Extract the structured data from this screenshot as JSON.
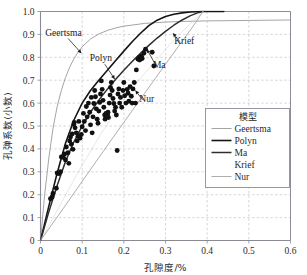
{
  "figure": {
    "name": "porosity-vs-pore-elastic-coefficient-scatter"
  },
  "chart_data": {
    "type": "scatter",
    "title": "",
    "xlabel": "孔隙度/%",
    "ylabel": "孔弹系数(小数)",
    "xlim": [
      0,
      0.6
    ],
    "ylim": [
      0,
      1.0
    ],
    "xticks": [
      "0",
      "0.1",
      "0.2",
      "0.3",
      "0.4",
      "0.5",
      "0.6"
    ],
    "xtick_values": [
      0,
      0.1,
      0.2,
      0.3,
      0.4,
      0.5,
      0.6
    ],
    "yticks": [
      "0",
      "0.1",
      "0.2",
      "0.3",
      "0.4",
      "0.5",
      "0.6",
      "0.7",
      "0.8",
      "0.9",
      "1.0"
    ],
    "ytick_values": [
      0,
      0.1,
      0.2,
      0.3,
      0.4,
      0.5,
      0.6,
      0.7,
      0.8,
      0.9,
      1.0
    ],
    "grid": true,
    "legend": {
      "position": "right-middle",
      "title": "模型",
      "entries": [
        {
          "label": "Geertsma",
          "color": "#9a9a9a",
          "width": 0.9,
          "sample": true
        },
        {
          "label": "Polyn",
          "color": "#151515",
          "width": 1.6,
          "sample": true
        },
        {
          "label": "Ma",
          "color": "#2e2e2e",
          "width": 1.5,
          "sample": true
        },
        {
          "label": "Krief",
          "color": "#cfcfcf",
          "width": 0.5,
          "sample": false
        },
        {
          "label": "Nur",
          "color": "#a5a5a5",
          "width": 0.9,
          "sample": true
        }
      ]
    },
    "annotations": [
      {
        "label": "Geertsma",
        "x": 0.055,
        "y": 0.905,
        "arrow_to": [
          0.098,
          0.818
        ]
      },
      {
        "label": "Polyn",
        "x": 0.145,
        "y": 0.795,
        "arrow_to": [
          0.178,
          0.705
        ]
      },
      {
        "label": "Ma",
        "x": 0.285,
        "y": 0.74,
        "arrow_to": [
          0.255,
          0.835
        ]
      },
      {
        "label": "Krief",
        "x": 0.345,
        "y": 0.845,
        "arrow_to": [
          0.318,
          0.905
        ]
      },
      {
        "label": "Nur",
        "x": 0.255,
        "y": 0.59,
        "arrow_to": [
          0.228,
          0.655
        ]
      }
    ],
    "series": [
      {
        "name": "Geertsma",
        "type": "line",
        "color": "#9a9a9a",
        "points": [
          [
            0,
            0
          ],
          [
            0.01,
            0.2
          ],
          [
            0.02,
            0.36
          ],
          [
            0.03,
            0.49
          ],
          [
            0.04,
            0.585
          ],
          [
            0.05,
            0.655
          ],
          [
            0.06,
            0.712
          ],
          [
            0.07,
            0.757
          ],
          [
            0.08,
            0.793
          ],
          [
            0.09,
            0.822
          ],
          [
            0.1,
            0.846
          ],
          [
            0.12,
            0.88
          ],
          [
            0.14,
            0.902
          ],
          [
            0.16,
            0.917
          ],
          [
            0.18,
            0.928
          ],
          [
            0.2,
            0.936
          ],
          [
            0.25,
            0.948
          ],
          [
            0.3,
            0.954
          ],
          [
            0.35,
            0.957
          ],
          [
            0.4,
            0.959
          ],
          [
            0.45,
            0.96
          ],
          [
            0.5,
            0.961
          ],
          [
            0.55,
            0.962
          ],
          [
            0.6,
            0.963
          ]
        ]
      },
      {
        "name": "Polyn",
        "type": "line",
        "color": "#151515",
        "points": [
          [
            0,
            0
          ],
          [
            0.02,
            0.15
          ],
          [
            0.04,
            0.295
          ],
          [
            0.06,
            0.425
          ],
          [
            0.08,
            0.525
          ],
          [
            0.1,
            0.6
          ],
          [
            0.12,
            0.655
          ],
          [
            0.14,
            0.7
          ],
          [
            0.16,
            0.742
          ],
          [
            0.18,
            0.785
          ],
          [
            0.2,
            0.827
          ],
          [
            0.22,
            0.868
          ],
          [
            0.24,
            0.905
          ],
          [
            0.26,
            0.938
          ],
          [
            0.28,
            0.962
          ],
          [
            0.3,
            0.978
          ],
          [
            0.32,
            0.988
          ],
          [
            0.34,
            0.994
          ],
          [
            0.36,
            0.998
          ],
          [
            0.385,
            1.0
          ],
          [
            0.44,
            1.0
          ]
        ]
      },
      {
        "name": "Ma",
        "type": "line",
        "color": "#2e2e2e",
        "points": [
          [
            0,
            0
          ],
          [
            0.02,
            0.125
          ],
          [
            0.04,
            0.24
          ],
          [
            0.06,
            0.345
          ],
          [
            0.08,
            0.43
          ],
          [
            0.1,
            0.5
          ],
          [
            0.12,
            0.56
          ],
          [
            0.14,
            0.613
          ],
          [
            0.16,
            0.66
          ],
          [
            0.18,
            0.703
          ],
          [
            0.2,
            0.743
          ],
          [
            0.22,
            0.782
          ],
          [
            0.24,
            0.818
          ],
          [
            0.26,
            0.852
          ],
          [
            0.28,
            0.884
          ],
          [
            0.3,
            0.913
          ],
          [
            0.32,
            0.94
          ],
          [
            0.34,
            0.963
          ],
          [
            0.36,
            0.982
          ],
          [
            0.38,
            0.996
          ],
          [
            0.39,
            1.0
          ]
        ]
      },
      {
        "name": "Krief",
        "type": "line",
        "color": "#cfcfcf",
        "points": [
          [
            0,
            0
          ],
          [
            0.05,
            0.165
          ],
          [
            0.1,
            0.33
          ],
          [
            0.15,
            0.48
          ],
          [
            0.2,
            0.615
          ],
          [
            0.25,
            0.73
          ],
          [
            0.28,
            0.793
          ],
          [
            0.31,
            0.855
          ],
          [
            0.34,
            0.912
          ],
          [
            0.36,
            0.947
          ],
          [
            0.38,
            0.98
          ],
          [
            0.39,
            1.0
          ]
        ]
      },
      {
        "name": "Nur",
        "type": "line",
        "color": "#a5a5a5",
        "points": [
          [
            0,
            0
          ],
          [
            0.05,
            0.128
          ],
          [
            0.1,
            0.258
          ],
          [
            0.15,
            0.388
          ],
          [
            0.2,
            0.516
          ],
          [
            0.25,
            0.643
          ],
          [
            0.3,
            0.77
          ],
          [
            0.34,
            0.87
          ],
          [
            0.37,
            0.945
          ],
          [
            0.39,
            1.0
          ]
        ]
      },
      {
        "name": "measured data",
        "type": "scatter",
        "marker": "filled-circle",
        "color": "#111111",
        "points": [
          [
            0.024,
            0.182
          ],
          [
            0.028,
            0.19
          ],
          [
            0.03,
            0.205
          ],
          [
            0.038,
            0.228
          ],
          [
            0.04,
            0.295
          ],
          [
            0.044,
            0.292
          ],
          [
            0.048,
            0.3
          ],
          [
            0.05,
            0.365
          ],
          [
            0.055,
            0.362
          ],
          [
            0.058,
            0.378
          ],
          [
            0.06,
            0.352
          ],
          [
            0.062,
            0.408
          ],
          [
            0.066,
            0.383
          ],
          [
            0.068,
            0.337
          ],
          [
            0.07,
            0.435
          ],
          [
            0.072,
            0.452
          ],
          [
            0.074,
            0.42
          ],
          [
            0.076,
            0.465
          ],
          [
            0.078,
            0.398
          ],
          [
            0.08,
            0.507
          ],
          [
            0.081,
            0.516
          ],
          [
            0.083,
            0.492
          ],
          [
            0.086,
            0.47
          ],
          [
            0.088,
            0.435
          ],
          [
            0.09,
            0.455
          ],
          [
            0.092,
            0.52
          ],
          [
            0.095,
            0.447
          ],
          [
            0.098,
            0.463
          ],
          [
            0.1,
            0.497
          ],
          [
            0.103,
            0.555
          ],
          [
            0.105,
            0.52
          ],
          [
            0.108,
            0.48
          ],
          [
            0.11,
            0.585
          ],
          [
            0.112,
            0.54
          ],
          [
            0.115,
            0.6
          ],
          [
            0.118,
            0.56
          ],
          [
            0.12,
            0.505
          ],
          [
            0.122,
            0.625
          ],
          [
            0.124,
            0.47
          ],
          [
            0.126,
            0.54
          ],
          [
            0.128,
            0.598
          ],
          [
            0.13,
            0.655
          ],
          [
            0.132,
            0.628
          ],
          [
            0.134,
            0.575
          ],
          [
            0.136,
            0.53
          ],
          [
            0.138,
            0.512
          ],
          [
            0.14,
            0.565
          ],
          [
            0.142,
            0.603
          ],
          [
            0.144,
            0.64
          ],
          [
            0.146,
            0.697
          ],
          [
            0.148,
            0.66
          ],
          [
            0.15,
            0.612
          ],
          [
            0.152,
            0.582
          ],
          [
            0.154,
            0.548
          ],
          [
            0.155,
            0.53
          ],
          [
            0.157,
            0.555
          ],
          [
            0.158,
            0.54
          ],
          [
            0.16,
            0.545
          ],
          [
            0.161,
            0.552
          ],
          [
            0.162,
            0.56
          ],
          [
            0.163,
            0.537
          ],
          [
            0.165,
            0.6
          ],
          [
            0.167,
            0.635
          ],
          [
            0.168,
            0.668
          ],
          [
            0.17,
            0.69
          ],
          [
            0.172,
            0.655
          ],
          [
            0.174,
            0.62
          ],
          [
            0.176,
            0.598
          ],
          [
            0.178,
            0.565
          ],
          [
            0.18,
            0.582
          ],
          [
            0.182,
            0.548
          ],
          [
            0.184,
            0.393
          ],
          [
            0.186,
            0.64
          ],
          [
            0.188,
            0.662
          ],
          [
            0.19,
            0.6
          ],
          [
            0.192,
            0.625
          ],
          [
            0.195,
            0.582
          ],
          [
            0.198,
            0.655
          ],
          [
            0.2,
            0.69
          ],
          [
            0.202,
            0.632
          ],
          [
            0.205,
            0.6
          ],
          [
            0.208,
            0.66
          ],
          [
            0.21,
            0.643
          ],
          [
            0.212,
            0.608
          ],
          [
            0.215,
            0.672
          ],
          [
            0.218,
            0.63
          ],
          [
            0.22,
            0.6
          ],
          [
            0.222,
            0.662
          ],
          [
            0.225,
            0.69
          ],
          [
            0.228,
            0.6
          ],
          [
            0.23,
            0.745
          ],
          [
            0.234,
            0.792
          ],
          [
            0.236,
            0.798
          ],
          [
            0.238,
            0.788
          ],
          [
            0.24,
            0.8
          ],
          [
            0.242,
            0.805
          ],
          [
            0.244,
            0.795
          ],
          [
            0.248,
            0.818
          ],
          [
            0.252,
            0.835
          ],
          [
            0.268,
            0.822
          ],
          [
            0.272,
            0.762
          ]
        ]
      }
    ]
  }
}
